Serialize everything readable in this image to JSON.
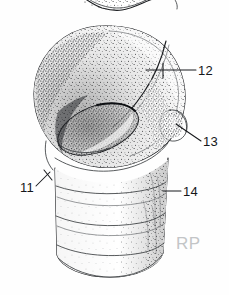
{
  "figure": {
    "kind": "anatomical-line-drawing",
    "technique": "stipple pen-and-ink",
    "background_color": "#ffffff",
    "ink_color": "#1b1d20",
    "width": 229,
    "height": 295
  },
  "labels": [
    {
      "id": "label-11",
      "text": "11",
      "text_x": 20,
      "text_y": 192,
      "leader": "M 36 186 L 50 172",
      "target": "lower left margin of articular head where it meets shaft"
    },
    {
      "id": "label-12",
      "text": "12",
      "text_x": 198,
      "text_y": 75,
      "leader": "M 196 70 L 146 70",
      "target": "curved ridge crossing the superior surface of the head"
    },
    {
      "id": "label-13",
      "text": "13",
      "text_x": 203,
      "text_y": 146,
      "leader": "M 201 141 L 176 124",
      "target": "tubercle projecting from the right margin"
    },
    {
      "id": "label-14",
      "text": "14",
      "text_x": 183,
      "text_y": 196,
      "leader": "M 181 191 L 163 191",
      "target": "upper ring band of the shaft"
    }
  ],
  "watermark": {
    "text": "RP",
    "x": 176,
    "y": 249,
    "color": "#c3c5c7"
  },
  "top_fragment": {
    "present": true,
    "description": "partially cropped wing-shaped bone fragment at top edge"
  },
  "shaft": {
    "ring_count": 3,
    "description": "cylindrical shaft with three horizontal ring bands"
  }
}
